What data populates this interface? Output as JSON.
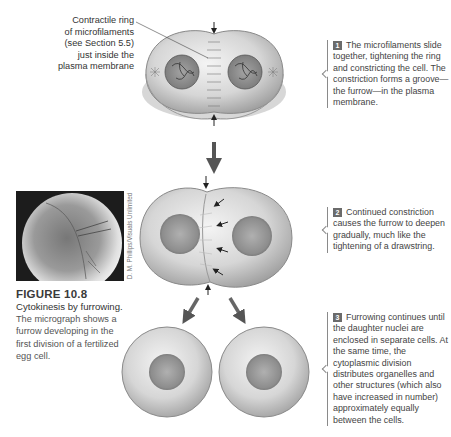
{
  "figure": {
    "number": "FIGURE 10.8",
    "title": "Cytokinesis by furrowing.",
    "description": "The micrograph shows a furrow developing in the first division of a fertilized egg cell.",
    "photo_credit": "D. M. Phillips/Visuals Unlimited"
  },
  "labels": {
    "contractile_ring": [
      "Contractile ring",
      "of microfilaments",
      "(see Section 5.5)",
      "just inside the",
      "plasma membrane"
    ]
  },
  "steps": [
    {
      "number": "1",
      "text": "The microfilaments slide together, tightening the ring and constricting the cell. The constriction forms a groove—the furrow—in the plasma membrane."
    },
    {
      "number": "2",
      "text": "Continued constriction causes the furrow to deepen gradually, much like the tightening of a drawstring."
    },
    {
      "number": "3",
      "text": "Furrowing continues until the daughter nuclei are enclosed in separate cells. At the same time, the cytoplasmic division distributes organelles and other structures (which also have increased in number) approximately equally between the cells."
    }
  ],
  "colors": {
    "badge": "#6b6b6b",
    "text": "#3a3a3a",
    "cell_fill": "#d9d9d9",
    "nucleus": "#8a8a8a"
  }
}
